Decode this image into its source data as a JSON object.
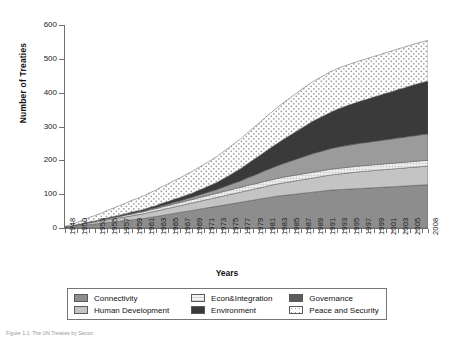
{
  "figure": {
    "caption": "Figure 1.1: The UN Treaties by Sector"
  },
  "axes": {
    "ylabel": "Number of Treaties",
    "xlabel": "Years",
    "yticks": [
      0,
      100,
      200,
      300,
      400,
      500,
      600
    ],
    "ylim": [
      0,
      600
    ],
    "xlim": [
      1948,
      2008
    ]
  },
  "legend": {
    "rows": [
      [
        {
          "label": "Connectivity",
          "color": "#8d8d8d",
          "pattern": "solid"
        },
        {
          "label": "Econ&Integration",
          "color": "#f0f0f0",
          "pattern": "solid"
        },
        {
          "label": "Governance",
          "color": "#5a5a5a",
          "pattern": "solid"
        }
      ],
      [
        {
          "label": "Human Development",
          "color": "#c4c4c4",
          "pattern": "solid"
        },
        {
          "label": "Environment",
          "color": "#3a3a3a",
          "pattern": "solid"
        },
        {
          "label": "Peace and Security",
          "color": "#ffffff",
          "pattern": "dotted"
        }
      ]
    ]
  },
  "chart_data": {
    "type": "area",
    "stacked": true,
    "title": "",
    "xlabel": "Years",
    "ylabel": "Number of Treaties",
    "ylim": [
      0,
      600
    ],
    "grid": false,
    "legend_position": "bottom",
    "x": [
      1948,
      1949,
      1950,
      1951,
      1952,
      1953,
      1954,
      1955,
      1956,
      1957,
      1958,
      1959,
      1960,
      1961,
      1962,
      1963,
      1964,
      1965,
      1966,
      1967,
      1968,
      1969,
      1970,
      1971,
      1972,
      1973,
      1974,
      1975,
      1976,
      1977,
      1978,
      1979,
      1980,
      1981,
      1982,
      1983,
      1984,
      1985,
      1986,
      1987,
      1988,
      1989,
      1990,
      1991,
      1992,
      1993,
      1994,
      1995,
      1996,
      1997,
      1998,
      1999,
      2000,
      2001,
      2002,
      2003,
      2004,
      2005,
      2006,
      2007,
      2008
    ],
    "tick_labels": [
      "1948",
      "1950",
      "1953",
      "1955",
      "1957",
      "1959",
      "1961",
      "1963",
      "1965",
      "1967",
      "1969",
      "1971",
      "1973",
      "1975",
      "1977",
      "1979",
      "1981",
      "1983",
      "1985",
      "1987",
      "1989",
      "1991",
      "1993",
      "1995",
      "1997",
      "1999",
      "2001",
      "2003",
      "2005",
      "2008"
    ],
    "series": [
      {
        "name": "Connectivity",
        "color": "#8d8d8d",
        "values": [
          2,
          4,
          6,
          8,
          10,
          12,
          14,
          16,
          18,
          20,
          22,
          24,
          26,
          28,
          31,
          34,
          37,
          40,
          43,
          46,
          49,
          52,
          55,
          58,
          61,
          64,
          67,
          70,
          73,
          76,
          79,
          82,
          85,
          88,
          91,
          94,
          96,
          98,
          100,
          102,
          104,
          106,
          108,
          110,
          112,
          113,
          114,
          115,
          116,
          117,
          118,
          119,
          120,
          121,
          122,
          123,
          124,
          125,
          126,
          127,
          128
        ]
      },
      {
        "name": "Human Development",
        "color": "#c4c4c4",
        "values": [
          1,
          2,
          3,
          4,
          5,
          6,
          7,
          8,
          9,
          10,
          11,
          12,
          13,
          14,
          15,
          16,
          17,
          18,
          19,
          20,
          21,
          22,
          23,
          24,
          25,
          26,
          27,
          28,
          29,
          30,
          31,
          32,
          33,
          34,
          35,
          36,
          37,
          38,
          39,
          40,
          41,
          42,
          43,
          44,
          45,
          46,
          47,
          48,
          49,
          50,
          50,
          51,
          51,
          52,
          52,
          53,
          53,
          54,
          54,
          55,
          55
        ]
      },
      {
        "name": "Econ&Integration",
        "color": "#f0f0f0",
        "values": [
          0,
          0,
          1,
          1,
          2,
          2,
          3,
          3,
          4,
          4,
          5,
          5,
          6,
          6,
          7,
          7,
          8,
          8,
          9,
          9,
          10,
          10,
          11,
          11,
          12,
          12,
          13,
          13,
          14,
          14,
          15,
          15,
          15,
          16,
          16,
          16,
          17,
          17,
          17,
          17,
          17,
          17,
          17,
          17,
          17,
          17,
          17,
          17,
          17,
          17,
          17,
          17,
          17,
          17,
          17,
          17,
          17,
          17,
          17,
          17,
          17
        ]
      },
      {
        "name": "Governance",
        "color": "#9b9b9b",
        "values": [
          0,
          0,
          0,
          0,
          0,
          0,
          0,
          1,
          1,
          1,
          1,
          2,
          2,
          2,
          3,
          3,
          4,
          4,
          5,
          5,
          6,
          7,
          8,
          9,
          10,
          11,
          13,
          15,
          17,
          19,
          22,
          25,
          28,
          31,
          34,
          37,
          40,
          43,
          46,
          49,
          52,
          55,
          57,
          59,
          61,
          63,
          64,
          65,
          66,
          67,
          68,
          69,
          70,
          71,
          72,
          73,
          74,
          75,
          76,
          77,
          78
        ]
      },
      {
        "name": "Environment",
        "color": "#3a3a3a",
        "values": [
          0,
          0,
          0,
          0,
          1,
          1,
          1,
          2,
          2,
          3,
          3,
          4,
          4,
          5,
          5,
          6,
          7,
          8,
          9,
          10,
          11,
          12,
          14,
          16,
          18,
          21,
          24,
          28,
          32,
          36,
          41,
          46,
          51,
          56,
          61,
          66,
          71,
          76,
          81,
          86,
          91,
          96,
          100,
          104,
          108,
          112,
          116,
          119,
          122,
          125,
          128,
          131,
          134,
          137,
          140,
          143,
          146,
          149,
          152,
          154,
          156
        ]
      },
      {
        "name": "Peace and Security",
        "color": "#ffffff",
        "values": [
          2,
          4,
          7,
          10,
          13,
          16,
          19,
          22,
          25,
          28,
          31,
          34,
          37,
          40,
          43,
          46,
          49,
          52,
          55,
          58,
          61,
          64,
          67,
          70,
          73,
          76,
          79,
          82,
          85,
          88,
          91,
          94,
          97,
          100,
          103,
          106,
          108,
          110,
          112,
          114,
          116,
          117,
          118,
          119,
          120,
          120,
          120,
          120,
          120,
          120,
          120,
          120,
          120,
          120,
          120,
          120,
          120,
          120,
          120,
          120,
          120
        ]
      }
    ],
    "totals_endpoint": {
      "year": 2008,
      "value": 500
    }
  }
}
